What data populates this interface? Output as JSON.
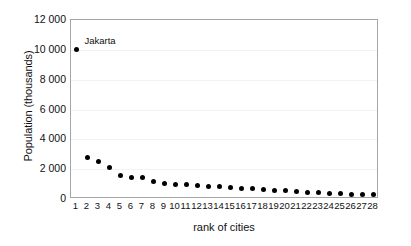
{
  "chart_data": {
    "type": "scatter",
    "title": "",
    "xlabel": "rank of cities",
    "ylabel": "Population (thousands)",
    "xlim": [
      0.5,
      28.5
    ],
    "ylim": [
      0,
      12000
    ],
    "grid": true,
    "legend": "none",
    "y_ticks": [
      "0",
      "2 000",
      "4 000",
      "6 000",
      "8 000",
      "10 000",
      "12 000"
    ],
    "y_tick_values": [
      0,
      2000,
      4000,
      6000,
      8000,
      10000,
      12000
    ],
    "x_ticks": [
      "1",
      "2",
      "3",
      "4",
      "5",
      "6",
      "7",
      "8",
      "9",
      "10",
      "11",
      "12",
      "13",
      "14",
      "15",
      "16",
      "17",
      "18",
      "19",
      "20",
      "21",
      "22",
      "23",
      "24",
      "25",
      "26",
      "27",
      "28"
    ],
    "x": [
      1,
      2,
      3,
      4,
      5,
      6,
      7,
      8,
      9,
      10,
      11,
      12,
      13,
      14,
      15,
      16,
      17,
      18,
      19,
      20,
      21,
      22,
      23,
      24,
      25,
      26,
      27,
      28
    ],
    "values": [
      10050,
      2800,
      2500,
      2100,
      1600,
      1450,
      1420,
      1170,
      1030,
      1000,
      960,
      930,
      870,
      810,
      780,
      700,
      680,
      620,
      580,
      570,
      490,
      440,
      420,
      380,
      370,
      330,
      310,
      300
    ],
    "annotations": [
      {
        "label": "Jakarta",
        "x": 1,
        "y": 10050
      }
    ],
    "marker": {
      "shape": "circle",
      "color": "#000000",
      "size": 5
    },
    "colors": {
      "background": "#ffffff",
      "axis": "#a6a6a6",
      "gridline": "#f2f2f2",
      "text": "#111111",
      "marker": "#000000"
    }
  }
}
